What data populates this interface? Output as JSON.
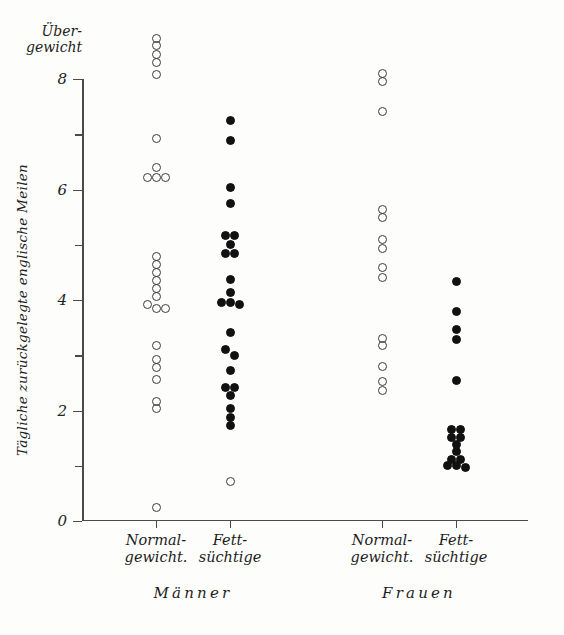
{
  "chart_data": {
    "type": "scatter",
    "title": "",
    "xlabel": "",
    "ylabel": "Tägliche zurückgelegte englische Meilen",
    "top_axis_note": "Über-\ngewicht",
    "ylim": [
      0,
      8
    ],
    "ytick_labels": [
      "0",
      "2",
      "4",
      "6",
      "8"
    ],
    "ytick_values": [
      0,
      2,
      4,
      6,
      8
    ],
    "yminor_ticks": [
      1,
      3,
      5,
      7
    ],
    "grid": false,
    "legend": "none",
    "groups": [
      {
        "name": "Männer",
        "columns": [
          {
            "label_line1": "Normal-",
            "label_line2": "gewicht.",
            "marker": "open",
            "values": [
              8.74,
              8.6,
              8.44,
              8.29,
              8.09,
              6.93,
              6.39,
              6.21,
              6.21,
              6.21,
              4.79,
              4.64,
              4.49,
              4.35,
              4.2,
              4.06,
              3.91,
              3.84,
              3.84,
              3.17,
              2.92,
              2.77,
              2.57,
              2.17,
              2.03,
              0.24
            ]
          },
          {
            "label_line1": "Fett-",
            "label_line2": "süchtige",
            "marker": "filled",
            "values": [
              7.24,
              6.88,
              6.03,
              5.75,
              5.16,
              5.16,
              5.0,
              4.85,
              4.85,
              4.38,
              4.13,
              3.95,
              3.95,
              3.91,
              3.42,
              3.1,
              3.0,
              2.73,
              2.41,
              2.41,
              2.28,
              2.04,
              1.88,
              1.73,
              0.71
            ]
          }
        ]
      },
      {
        "name": "Frauen",
        "columns": [
          {
            "label_line1": "Normal-",
            "label_line2": "gewicht.",
            "marker": "open",
            "values": [
              8.1,
              7.96,
              7.42,
              5.63,
              5.49,
              5.09,
              4.94,
              4.58,
              4.4,
              3.31,
              3.18,
              2.79,
              2.52,
              2.37
            ]
          },
          {
            "label_line1": "Fett-",
            "label_line2": "süchtige",
            "marker": "filled",
            "values": [
              4.33,
              3.8,
              3.46,
              3.29,
              2.55,
              1.65,
              1.65,
              1.52,
              1.52,
              1.38,
              1.25,
              1.12,
              1.12,
              1.0,
              1.0,
              0.96
            ]
          }
        ]
      }
    ]
  },
  "figure": {
    "marker_open_color": "#3b3b3b",
    "marker_filled_color": "#111111",
    "axis_color": "#4a4a48",
    "background": "#fdfdfb"
  }
}
